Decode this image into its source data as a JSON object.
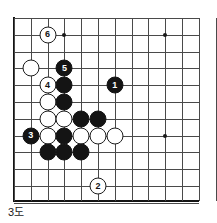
{
  "diagram": {
    "caption": "3도",
    "type": "go-board-diagram",
    "colors": {
      "black_stone": "#141414",
      "white_stone": "#ffffff",
      "stone_outline": "#1c1c1c",
      "grid_line": "#4a4a4a",
      "board_edge": "#141414",
      "background": "#ffffff"
    }
  },
  "board": {
    "cols": 12,
    "rows": 11,
    "cell_size": 16.8,
    "origin_x": 14,
    "origin_y": 18,
    "edges_shown": [
      "left",
      "bottom"
    ],
    "star_points": [
      {
        "col": 3,
        "row": 1
      },
      {
        "col": 9,
        "row": 1
      },
      {
        "col": 9,
        "row": 7
      }
    ]
  },
  "stones": [
    {
      "id": "w-6",
      "color": "white",
      "col": 2,
      "row": 1,
      "label": "6"
    },
    {
      "id": "w-a",
      "color": "white",
      "col": 1,
      "row": 3,
      "label": ""
    },
    {
      "id": "b-5",
      "color": "black",
      "col": 3,
      "row": 3,
      "label": "5"
    },
    {
      "id": "w-4",
      "color": "white",
      "col": 2,
      "row": 4,
      "label": "4"
    },
    {
      "id": "b-b",
      "color": "black",
      "col": 3,
      "row": 4,
      "label": ""
    },
    {
      "id": "b-1",
      "color": "black",
      "col": 6,
      "row": 4,
      "label": "1"
    },
    {
      "id": "w-c",
      "color": "white",
      "col": 2,
      "row": 5,
      "label": ""
    },
    {
      "id": "b-d",
      "color": "black",
      "col": 3,
      "row": 5,
      "label": ""
    },
    {
      "id": "w-e",
      "color": "white",
      "col": 2,
      "row": 6,
      "label": ""
    },
    {
      "id": "w-f",
      "color": "white",
      "col": 3,
      "row": 6,
      "label": ""
    },
    {
      "id": "b-g",
      "color": "black",
      "col": 4,
      "row": 6,
      "label": ""
    },
    {
      "id": "b-h",
      "color": "black",
      "col": 5,
      "row": 6,
      "label": ""
    },
    {
      "id": "b-3",
      "color": "black",
      "col": 1,
      "row": 7,
      "label": "3"
    },
    {
      "id": "w-i",
      "color": "white",
      "col": 2,
      "row": 7,
      "label": ""
    },
    {
      "id": "b-j",
      "color": "black",
      "col": 3,
      "row": 7,
      "label": ""
    },
    {
      "id": "w-k",
      "color": "white",
      "col": 4,
      "row": 7,
      "label": ""
    },
    {
      "id": "w-l",
      "color": "white",
      "col": 5,
      "row": 7,
      "label": ""
    },
    {
      "id": "w-m",
      "color": "white",
      "col": 6,
      "row": 7,
      "label": ""
    },
    {
      "id": "b-n",
      "color": "black",
      "col": 2,
      "row": 8,
      "label": ""
    },
    {
      "id": "b-o",
      "color": "black",
      "col": 3,
      "row": 8,
      "label": ""
    },
    {
      "id": "b-p",
      "color": "black",
      "col": 4,
      "row": 8,
      "label": ""
    },
    {
      "id": "w-2",
      "color": "white",
      "col": 5,
      "row": 10,
      "label": "2"
    }
  ]
}
